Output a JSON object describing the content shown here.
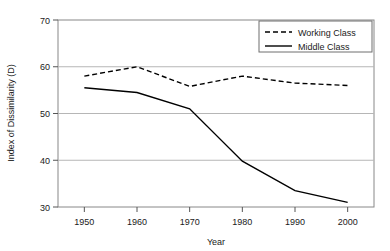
{
  "chart_data": {
    "type": "line",
    "title": "",
    "xlabel": "Year",
    "ylabel": "Index of Dissimilarity (D)",
    "x": [
      1950,
      1960,
      1970,
      1980,
      1990,
      2000
    ],
    "xticks": [
      "1950",
      "1960",
      "1970",
      "1980",
      "1990",
      "2000"
    ],
    "yticks": [
      "30",
      "40",
      "50",
      "60",
      "70"
    ],
    "xlim": [
      1945,
      2005
    ],
    "ylim": [
      30,
      70
    ],
    "grid": "horizontal",
    "legend_position": "top-right",
    "series": [
      {
        "name": "Working Class",
        "style": "dashed",
        "color": "#000000",
        "values": [
          58,
          60,
          55.8,
          58,
          56.5,
          56
        ]
      },
      {
        "name": "Middle Class",
        "style": "solid",
        "color": "#000000",
        "values": [
          55.5,
          54.5,
          51,
          39.8,
          33.5,
          31
        ]
      }
    ]
  }
}
